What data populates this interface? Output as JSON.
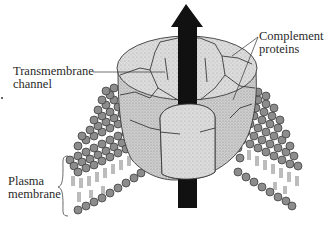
{
  "figure": {
    "type": "diagram",
    "colors": {
      "background": "#ffffff",
      "protein_fill": "#d9d9d9",
      "protein_outline": "#3a3a3a",
      "lipid_head": "#8c8c8c",
      "lipid_outline": "#333333",
      "arrow": "#111111",
      "text": "#2a2a2a"
    }
  },
  "labels": {
    "complement_line1": "Complement",
    "complement_line2": "proteins",
    "transmembrane_line1": "Transmembrane",
    "transmembrane_line2": "channel",
    "plasma_line1": "Plasma",
    "plasma_line2": "membrane"
  },
  "elements": {
    "arrow": "upward-arrow-through-channel",
    "channel": "ring-of-complement-proteins",
    "membrane": "phospholipid-bilayer-left-and-right",
    "bracket": "curly-brace-plasma-membrane"
  }
}
